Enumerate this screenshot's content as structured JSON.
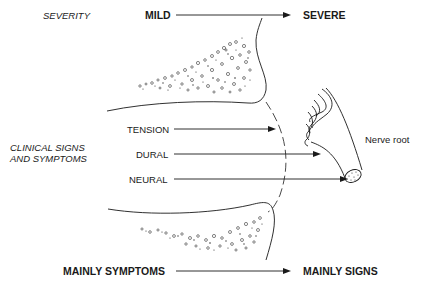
{
  "diagram": {
    "header": {
      "axis_label": "SEVERITY",
      "start_label": "MILD",
      "end_label": "SEVERE"
    },
    "side_label": {
      "line1": "CLINICAL SIGNS",
      "line2": "AND SYMPTOMS"
    },
    "levels": [
      {
        "label": "TENSION"
      },
      {
        "label": "DURAL"
      },
      {
        "label": "NEURAL"
      }
    ],
    "structure_label": "Nerve root",
    "footer": {
      "start_label": "MAINLY SYMPTOMS",
      "end_label": "MAINLY SIGNS"
    },
    "colors": {
      "ink": "#1a1a1a",
      "background": "#ffffff"
    }
  }
}
